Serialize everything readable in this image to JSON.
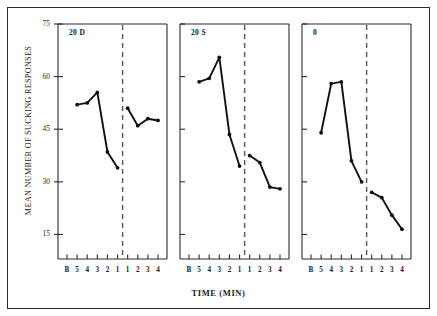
{
  "chart_data": {
    "type": "line",
    "title": "",
    "xlabel": "TIME (MIN)",
    "ylabel": "MEAN NUMBER OF SUCKING RESPONSES",
    "ylim": [
      8,
      75
    ],
    "yticks": [
      15,
      30,
      45,
      60,
      75
    ],
    "ytick_labels": [
      "15",
      "30",
      "45",
      "60",
      "75"
    ],
    "categories": [
      "B",
      "5",
      "4",
      "3",
      "2",
      "1",
      "1",
      "2",
      "3",
      "4"
    ],
    "xtick_labels": [
      "B",
      "5",
      "4",
      "3",
      "2",
      "1",
      "1",
      "2",
      "3",
      "4"
    ],
    "grid": false,
    "legend": "none",
    "divider": {
      "style": "dashed",
      "after_category_index": 5,
      "label": "test-phase-divider"
    },
    "panels": [
      {
        "name": "20 D",
        "label": "20 D",
        "values": [
          52.0,
          52.5,
          55.5,
          38.5,
          34.0,
          51.0,
          46.0,
          48.0,
          47.5
        ]
      },
      {
        "name": "20 S",
        "label": "20 S",
        "values": [
          58.5,
          59.5,
          65.5,
          43.5,
          34.5,
          37.5,
          35.5,
          28.5,
          28.0
        ]
      },
      {
        "name": "0",
        "label": "0",
        "values": [
          44.0,
          58.0,
          58.5,
          36.0,
          30.0,
          27.0,
          25.5,
          20.5,
          16.5
        ]
      }
    ],
    "series_note": "Each panel plots 5 pre-divider points (B..1 uses last 5 of categories before divider) and 4 post-divider points"
  },
  "colors": {
    "line": "#111111",
    "axis": "#2b2b2b",
    "divider": "#555555",
    "background": "#ffffff"
  }
}
